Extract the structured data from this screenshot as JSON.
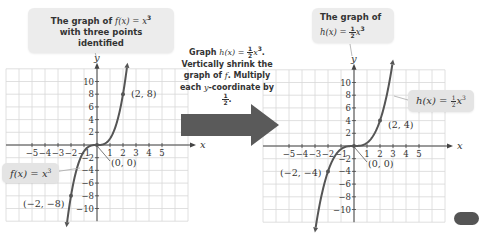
{
  "left_callout": {
    "line1_prefix": "The graph of ",
    "line1_math": "f(x) = x",
    "line1_exp": "3",
    "line2": "with three points identified"
  },
  "right_callout": {
    "line1": "The graph of",
    "line2_math": "h(x) = ",
    "frac_num": "1",
    "frac_den": "2",
    "line2_tail": "x",
    "line2_exp": "3"
  },
  "transform_description": {
    "line1_prefix": "Graph ",
    "line1_math": "h(x) = ",
    "line1_frac_num": "1",
    "line1_frac_den": "2",
    "line1_tail": "x",
    "line1_exp": "3",
    "line1_end": ".",
    "line2": "Vertically shrink the",
    "line3_prefix": "graph of ",
    "line3_math": "f",
    "line3_suffix": ". Multiply",
    "line4_prefix": "each ",
    "line4_math": "y",
    "line4_suffix": "-coordinate by ",
    "line4_frac_num": "1",
    "line4_frac_den": "2",
    "line4_end": "."
  },
  "left_eq_label": {
    "math": "f(x) = x",
    "exp": "3"
  },
  "right_eq_label": {
    "math": "h(x) = ",
    "frac_num": "1",
    "frac_den": "2",
    "tail": "x",
    "exp": "3"
  },
  "colors": {
    "curve": "#555555",
    "grid": "#d8d8d8",
    "axis": "#444444",
    "callout_bg": "#ececec",
    "arrow": "#5a5a5a",
    "text": "#333333"
  },
  "chart_data": [
    {
      "type": "line",
      "title": "The graph of f(x) = x^3 with three points identified",
      "function": "f(x) = x^3",
      "xlabel": "x",
      "ylabel": "y",
      "xlim": [
        -7,
        7
      ],
      "ylim": [
        -12,
        12
      ],
      "grid": true,
      "x_ticks": [
        -5,
        -4,
        -3,
        -2,
        -1,
        1,
        2,
        3,
        4,
        5
      ],
      "y_ticks": [
        -10,
        -8,
        -6,
        -4,
        -2,
        2,
        4,
        6,
        8,
        10
      ],
      "x_tick_labels": [
        "−5",
        "−4",
        "−3",
        "−2",
        "−1",
        "1",
        "2",
        "3",
        "4",
        "5"
      ],
      "y_tick_labels": [
        "−10",
        "−8",
        "−6",
        "−4",
        "−2",
        "2",
        "4",
        "6",
        "8",
        "10"
      ],
      "series": [
        {
          "name": "f(x) = x^3",
          "scale": 1,
          "x_range": [
            -2.3,
            2.3
          ]
        }
      ],
      "points": [
        {
          "x": -2,
          "y": -8,
          "label": "(−2, −8)"
        },
        {
          "x": 0,
          "y": 0,
          "label": "(0, 0)"
        },
        {
          "x": 2,
          "y": 8,
          "label": "(2, 8)"
        }
      ]
    },
    {
      "type": "line",
      "title": "The graph of h(x) = 1/2 x^3",
      "function": "h(x) = 1/2 x^3",
      "xlabel": "x",
      "ylabel": "y",
      "xlim": [
        -7,
        7
      ],
      "ylim": [
        -12,
        12
      ],
      "grid": true,
      "x_ticks": [
        -5,
        -4,
        -3,
        -2,
        -1,
        1,
        2,
        3,
        4,
        5
      ],
      "y_ticks": [
        -10,
        -8,
        -6,
        -4,
        -2,
        2,
        4,
        6,
        8,
        10
      ],
      "x_tick_labels": [
        "−5",
        "−4",
        "−3",
        "−2",
        "−1",
        "1",
        "2",
        "3",
        "4",
        "5"
      ],
      "y_tick_labels": [
        "−10",
        "−8",
        "−6",
        "−4",
        "−2",
        "2",
        "4",
        "6",
        "8",
        "10"
      ],
      "series": [
        {
          "name": "h(x) = 1/2 x^3",
          "scale": 0.5,
          "x_range": [
            -2.95,
            2.95
          ]
        }
      ],
      "points": [
        {
          "x": -2,
          "y": -4,
          "label": "(−2, −4)"
        },
        {
          "x": 0,
          "y": 0,
          "label": "(0, 0)"
        },
        {
          "x": 2,
          "y": 4,
          "label": "(2, 4)"
        }
      ]
    }
  ]
}
